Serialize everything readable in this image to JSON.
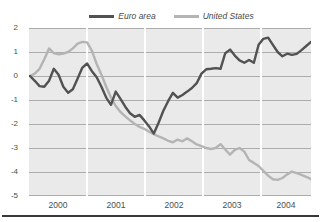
{
  "chart_data": {
    "type": "line",
    "title": "",
    "x_start": "2000-01",
    "x_unit": "monthly",
    "xticks": [
      "2000",
      "2001",
      "2002",
      "2003",
      "2004"
    ],
    "yticks": [
      "2",
      "1",
      "0",
      "-1",
      "-2",
      "-3",
      "-4",
      "-5"
    ],
    "ylim": [
      -5,
      2
    ],
    "grid": {
      "horizontal": true,
      "vertical_year_separators": true
    },
    "legend_position": "top-center",
    "series": [
      {
        "name": "Euro area",
        "color": "#525252",
        "values": [
          0.0,
          -0.2,
          -0.42,
          -0.45,
          -0.2,
          0.3,
          0.05,
          -0.45,
          -0.7,
          -0.55,
          -0.1,
          0.35,
          0.52,
          0.2,
          -0.05,
          -0.45,
          -0.9,
          -1.2,
          -0.65,
          -0.95,
          -1.28,
          -1.55,
          -1.7,
          -1.62,
          -1.85,
          -2.1,
          -2.4,
          -1.95,
          -1.45,
          -1.05,
          -0.7,
          -0.9,
          -0.79,
          -0.65,
          -0.5,
          -0.3,
          0.1,
          0.28,
          0.3,
          0.33,
          0.3,
          0.95,
          1.1,
          0.85,
          0.65,
          0.55,
          0.67,
          0.55,
          1.3,
          1.55,
          1.6,
          1.3,
          1.0,
          0.82,
          0.93,
          0.88,
          0.92,
          1.08,
          1.25,
          1.42
        ]
      },
      {
        "name": "United States",
        "color": "#b4b4b4",
        "values": [
          0.0,
          0.1,
          0.3,
          0.7,
          1.15,
          0.95,
          0.9,
          0.93,
          1.0,
          1.15,
          1.35,
          1.42,
          1.4,
          1.05,
          0.5,
          0.05,
          -0.45,
          -0.9,
          -1.25,
          -1.5,
          -1.68,
          -1.85,
          -2.0,
          -2.12,
          -2.2,
          -2.32,
          -2.42,
          -2.52,
          -2.6,
          -2.7,
          -2.76,
          -2.65,
          -2.72,
          -2.6,
          -2.72,
          -2.85,
          -2.92,
          -3.0,
          -3.04,
          -3.0,
          -2.84,
          -3.06,
          -3.28,
          -3.08,
          -3.0,
          -3.15,
          -3.5,
          -3.62,
          -3.75,
          -3.95,
          -4.15,
          -4.3,
          -4.33,
          -4.25,
          -4.1,
          -3.98,
          -4.05,
          -4.12,
          -4.2,
          -4.3
        ]
      }
    ]
  },
  "colors": {
    "plot_background": "#eaeaea",
    "gridline": "#acacac",
    "year_separator": "#ffffff",
    "tick_text": "#4d4d4d",
    "bottom_rule": "#383838"
  }
}
